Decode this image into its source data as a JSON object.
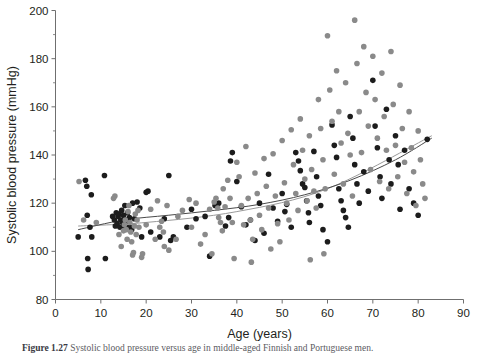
{
  "chart_data": {
    "type": "scatter",
    "title": "",
    "xlabel": "Age (years)",
    "ylabel": "Systolic blood pressure (mmHg)",
    "xlim": [
      0,
      90
    ],
    "ylim": [
      80,
      200
    ],
    "xticks": [
      0,
      10,
      20,
      30,
      40,
      50,
      60,
      70,
      80,
      90
    ],
    "yticks": [
      80,
      100,
      120,
      140,
      160,
      180,
      200
    ],
    "y_minor_ticks": [
      90,
      110,
      130,
      150,
      170,
      190
    ],
    "grid": false,
    "legend": "none",
    "series": [
      {
        "name": "group-dark",
        "color": "#1c1c1c",
        "marker": "circle",
        "points": [
          [
            5.0,
            106.0
          ],
          [
            6.6,
            129.5
          ],
          [
            6.9,
            127.0
          ],
          [
            7.0,
            115.0
          ],
          [
            7.1,
            97.0
          ],
          [
            7.2,
            92.5
          ],
          [
            7.6,
            110.0
          ],
          [
            7.9,
            123.5
          ],
          [
            8.0,
            106.0
          ],
          [
            10.8,
            131.5
          ],
          [
            11.0,
            97.0
          ],
          [
            12.6,
            114.5
          ],
          [
            13.0,
            113.0
          ],
          [
            13.2,
            110.5
          ],
          [
            13.4,
            116.0
          ],
          [
            13.6,
            111.5
          ],
          [
            13.8,
            114.5
          ],
          [
            14.0,
            115.5
          ],
          [
            14.2,
            110.0
          ],
          [
            14.4,
            113.0
          ],
          [
            14.6,
            117.0
          ],
          [
            14.8,
            112.0
          ],
          [
            15.0,
            115.0
          ],
          [
            15.1,
            110.5
          ],
          [
            15.3,
            119.0
          ],
          [
            15.5,
            113.0
          ],
          [
            15.7,
            110.0
          ],
          [
            15.9,
            116.0
          ],
          [
            16.1,
            112.5
          ],
          [
            16.3,
            114.0
          ],
          [
            16.5,
            110.0
          ],
          [
            16.8,
            109.0
          ],
          [
            17.0,
            120.0
          ],
          [
            17.4,
            113.5
          ],
          [
            18.0,
            120.5
          ],
          [
            18.6,
            118.0
          ],
          [
            19.0,
            106.0
          ],
          [
            20.0,
            124.5
          ],
          [
            20.4,
            125.0
          ],
          [
            21.0,
            108.0
          ],
          [
            23.0,
            106.0
          ],
          [
            24.0,
            113.5
          ],
          [
            25.0,
            131.5
          ],
          [
            25.4,
            104.5
          ],
          [
            26.0,
            106.0
          ],
          [
            29.0,
            110.0
          ],
          [
            30.0,
            117.5
          ],
          [
            31.0,
            113.5
          ],
          [
            33.0,
            114.5
          ],
          [
            34.0,
            98.0
          ],
          [
            35.2,
            119.0
          ],
          [
            36.0,
            120.0
          ],
          [
            37.5,
            110.5
          ],
          [
            38.2,
            114.0
          ],
          [
            38.6,
            137.5
          ],
          [
            39.0,
            141.0
          ],
          [
            40.0,
            129.0
          ],
          [
            41.0,
            118.5
          ],
          [
            42.0,
            111.0
          ],
          [
            43.0,
            113.0
          ],
          [
            44.0,
            104.5
          ],
          [
            45.0,
            120.0
          ],
          [
            46.0,
            107.5
          ],
          [
            47.0,
            132.0
          ],
          [
            48.0,
            118.0
          ],
          [
            49.0,
            112.5
          ],
          [
            50.0,
            124.0
          ],
          [
            50.6,
            116.5
          ],
          [
            51.0,
            119.5
          ],
          [
            52.0,
            110.0
          ],
          [
            53.0,
            141.0
          ],
          [
            53.6,
            137.5
          ],
          [
            54.0,
            133.5
          ],
          [
            54.5,
            128.0
          ],
          [
            55.0,
            126.5
          ],
          [
            55.4,
            121.0
          ],
          [
            55.8,
            116.0
          ],
          [
            56.0,
            112.0
          ],
          [
            57.0,
            141.5
          ],
          [
            57.6,
            131.0
          ],
          [
            58.0,
            123.0
          ],
          [
            58.5,
            119.0
          ],
          [
            59.0,
            109.0
          ],
          [
            60.0,
            104.0
          ],
          [
            61.0,
            152.5
          ],
          [
            61.5,
            144.0
          ],
          [
            62.0,
            139.0
          ],
          [
            62.5,
            126.0
          ],
          [
            63.0,
            121.0
          ],
          [
            63.5,
            117.0
          ],
          [
            64.0,
            114.0
          ],
          [
            64.6,
            110.0
          ],
          [
            65.0,
            156.0
          ],
          [
            65.6,
            147.0
          ],
          [
            66.0,
            136.0
          ],
          [
            66.5,
            128.0
          ],
          [
            67.0,
            120.0
          ],
          [
            68.0,
            133.0
          ],
          [
            69.0,
            125.0
          ],
          [
            70.0,
            171.0
          ],
          [
            70.5,
            152.0
          ],
          [
            71.0,
            143.0
          ],
          [
            71.6,
            131.0
          ],
          [
            72.0,
            122.0
          ],
          [
            73.0,
            159.0
          ],
          [
            73.6,
            138.0
          ],
          [
            74.0,
            128.0
          ],
          [
            75.0,
            148.0
          ],
          [
            75.6,
            136.0
          ],
          [
            76.0,
            117.5
          ],
          [
            77.0,
            142.0
          ],
          [
            78.0,
            126.0
          ],
          [
            79.0,
            120.0
          ],
          [
            80.0,
            115.0
          ],
          [
            82.0,
            146.5
          ]
        ]
      },
      {
        "name": "group-gray",
        "color": "#8a8a8a",
        "marker": "circle",
        "points": [
          [
            12.8,
            122.0
          ],
          [
            13.1,
            123.0
          ],
          [
            14.0,
            107.0
          ],
          [
            14.5,
            102.0
          ],
          [
            15.0,
            108.5
          ],
          [
            15.2,
            111.0
          ],
          [
            15.4,
            113.0
          ],
          [
            15.6,
            109.0
          ],
          [
            15.8,
            105.0
          ],
          [
            16.0,
            116.5
          ],
          [
            16.2,
            119.0
          ],
          [
            16.4,
            112.0
          ],
          [
            16.6,
            108.0
          ],
          [
            16.8,
            104.0
          ],
          [
            17.0,
            98.5
          ],
          [
            17.2,
            99.5
          ],
          [
            17.4,
            110.5
          ],
          [
            17.6,
            115.5
          ],
          [
            17.8,
            107.0
          ],
          [
            18.0,
            113.0
          ],
          [
            18.2,
            117.0
          ],
          [
            18.4,
            110.0
          ],
          [
            19.0,
            97.5
          ],
          [
            19.2,
            99.0
          ],
          [
            20.0,
            111.0
          ],
          [
            21.0,
            117.5
          ],
          [
            22.0,
            105.0
          ],
          [
            23.0,
            110.0
          ],
          [
            23.4,
            112.5
          ],
          [
            23.8,
            108.0
          ],
          [
            24.0,
            102.0
          ],
          [
            24.6,
            119.0
          ],
          [
            25.0,
            100.5
          ],
          [
            26.6,
            105.0
          ],
          [
            28.0,
            117.0
          ],
          [
            30.0,
            110.0
          ],
          [
            31.0,
            120.0
          ],
          [
            32.0,
            103.0
          ],
          [
            33.0,
            107.0
          ],
          [
            34.0,
            117.5
          ],
          [
            35.0,
            120.5
          ],
          [
            35.4,
            122.0
          ],
          [
            35.8,
            118.0
          ],
          [
            36.0,
            114.0
          ],
          [
            36.4,
            112.0
          ],
          [
            36.8,
            108.5
          ],
          [
            37.0,
            126.0
          ],
          [
            37.4,
            118.5
          ],
          [
            38.0,
            129.5
          ],
          [
            38.5,
            122.0
          ],
          [
            39.0,
            112.0
          ],
          [
            39.4,
            97.0
          ],
          [
            40.0,
            137.0
          ],
          [
            40.5,
            131.0
          ],
          [
            41.0,
            119.0
          ],
          [
            41.5,
            111.0
          ],
          [
            42.0,
            143.5
          ],
          [
            42.5,
            122.0
          ],
          [
            43.0,
            113.0
          ],
          [
            43.5,
            105.0
          ],
          [
            44.0,
            132.5
          ],
          [
            44.5,
            124.0
          ],
          [
            45.0,
            115.0
          ],
          [
            45.5,
            109.0
          ],
          [
            46.0,
            138.5
          ],
          [
            46.5,
            127.0
          ],
          [
            47.0,
            118.0
          ],
          [
            47.5,
            101.0
          ],
          [
            48.0,
            140.5
          ],
          [
            48.5,
            123.0
          ],
          [
            49.0,
            111.5
          ],
          [
            49.5,
            104.0
          ],
          [
            50.0,
            146.0
          ],
          [
            50.5,
            128.5
          ],
          [
            51.0,
            120.0
          ],
          [
            51.5,
            113.0
          ],
          [
            52.0,
            150.5
          ],
          [
            52.5,
            136.0
          ],
          [
            53.0,
            124.0
          ],
          [
            53.5,
            117.0
          ],
          [
            54.0,
            155.0
          ],
          [
            54.5,
            142.0
          ],
          [
            55.0,
            130.0
          ],
          [
            55.5,
            121.0
          ],
          [
            56.0,
            148.0
          ],
          [
            56.5,
            134.0
          ],
          [
            57.0,
            125.0
          ],
          [
            57.5,
            118.0
          ],
          [
            58.0,
            163.0
          ],
          [
            58.5,
            151.0
          ],
          [
            59.0,
            138.0
          ],
          [
            59.5,
            126.0
          ],
          [
            60.0,
            189.5
          ],
          [
            60.5,
            167.0
          ],
          [
            61.0,
            154.0
          ],
          [
            61.5,
            132.0
          ],
          [
            62.0,
            175.0
          ],
          [
            62.5,
            158.0
          ],
          [
            63.0,
            145.0
          ],
          [
            63.5,
            128.0
          ],
          [
            64.0,
            170.0
          ],
          [
            64.5,
            149.0
          ],
          [
            65.0,
            140.0
          ],
          [
            65.5,
            123.0
          ],
          [
            66.0,
            196.0
          ],
          [
            66.5,
            178.0
          ],
          [
            67.0,
            158.0
          ],
          [
            67.5,
            141.0
          ],
          [
            68.0,
            185.0
          ],
          [
            68.5,
            166.0
          ],
          [
            69.0,
            152.0
          ],
          [
            69.5,
            134.0
          ],
          [
            70.0,
            181.0
          ],
          [
            70.5,
            163.0
          ],
          [
            71.0,
            147.0
          ],
          [
            71.5,
            129.0
          ],
          [
            72.0,
            174.0
          ],
          [
            72.5,
            156.0
          ],
          [
            73.0,
            142.0
          ],
          [
            73.5,
            126.0
          ],
          [
            74.0,
            183.0
          ],
          [
            74.5,
            161.0
          ],
          [
            75.0,
            144.0
          ],
          [
            75.5,
            131.0
          ],
          [
            76.0,
            169.0
          ],
          [
            76.5,
            151.0
          ],
          [
            77.0,
            137.0
          ],
          [
            77.5,
            124.0
          ],
          [
            78.0,
            158.0
          ],
          [
            78.5,
            143.0
          ],
          [
            79.0,
            133.0
          ],
          [
            79.5,
            119.0
          ],
          [
            80.0,
            150.0
          ],
          [
            80.5,
            138.0
          ],
          [
            81.0,
            128.0
          ],
          [
            81.5,
            122.0
          ],
          [
            5.2,
            129.0
          ],
          [
            6.2,
            113.0
          ],
          [
            9.0,
            112.0
          ],
          [
            22.5,
            121.0
          ],
          [
            27.0,
            114.5
          ],
          [
            29.5,
            121.5
          ],
          [
            34.5,
            99.0
          ],
          [
            43.2,
            95.5
          ],
          [
            56.2,
            96.5
          ],
          [
            59.2,
            99.0
          ]
        ]
      }
    ],
    "trend_lines": [
      {
        "name": "gray-trend",
        "color": "#9a9a9a",
        "style": "straight",
        "points": [
          [
            5.0,
            110.5
          ],
          [
            20.0,
            112.0
          ],
          [
            40.0,
            116.5
          ],
          [
            60.0,
            126.0
          ],
          [
            83.0,
            148.0
          ]
        ]
      },
      {
        "name": "dark-trend",
        "color": "#4a4a4a",
        "style": "curved",
        "points": [
          [
            5.0,
            109.0
          ],
          [
            15.0,
            113.0
          ],
          [
            25.0,
            115.0
          ],
          [
            35.0,
            117.0
          ],
          [
            45.0,
            119.5
          ],
          [
            55.0,
            123.5
          ],
          [
            65.0,
            129.5
          ],
          [
            75.0,
            138.0
          ],
          [
            83.0,
            147.0
          ]
        ]
      }
    ]
  },
  "caption": {
    "label": "Figure 1.27",
    "text": "Systolic blood pressure versus age in middle-aged Finnish and Portuguese men."
  }
}
